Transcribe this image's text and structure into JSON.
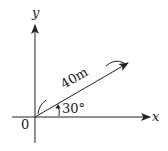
{
  "diagram": {
    "type": "vector-coordinate-diagram",
    "axes": {
      "x_label": "x",
      "y_label": "y",
      "origin_label": "0"
    },
    "vector": {
      "magnitude_label": "40m",
      "angle_label": "30°",
      "angle_degrees": 30
    },
    "colors": {
      "stroke": "#222222",
      "background": "#ffffff"
    }
  }
}
